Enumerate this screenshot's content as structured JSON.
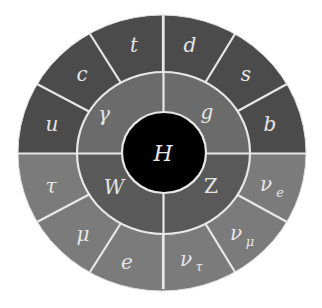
{
  "diagram": {
    "center": {
      "label": "H",
      "name": "higgs-boson"
    },
    "middle_ring": [
      {
        "label": "γ",
        "name": "photon",
        "group": "gauge-boson"
      },
      {
        "label": "g",
        "name": "gluon",
        "group": "gauge-boson"
      },
      {
        "label": "Z",
        "name": "z-boson",
        "group": "gauge-boson"
      },
      {
        "label": "W",
        "name": "w-boson",
        "group": "gauge-boson"
      }
    ],
    "outer_ring_top": [
      {
        "label": "u",
        "name": "up-quark"
      },
      {
        "label": "c",
        "name": "charm-quark"
      },
      {
        "label": "t",
        "name": "top-quark"
      },
      {
        "label": "d",
        "name": "down-quark"
      },
      {
        "label": "s",
        "name": "strange-quark"
      },
      {
        "label": "b",
        "name": "bottom-quark"
      }
    ],
    "outer_ring_bottom": [
      {
        "label": "τ",
        "name": "tau"
      },
      {
        "label": "μ",
        "name": "muon"
      },
      {
        "label": "e",
        "name": "electron"
      },
      {
        "label": "ν",
        "sub": "τ",
        "name": "tau-neutrino"
      },
      {
        "label": "ν",
        "sub": "μ",
        "name": "muon-neutrino"
      },
      {
        "label": "ν",
        "sub": "e",
        "name": "electron-neutrino"
      }
    ],
    "colors": {
      "outer_top": "#4b4b4b",
      "outer_bottom": "#7b7b7b",
      "middle_top": "#6b6b6b",
      "middle_bottom": "#595959",
      "center": "#000000",
      "divider": "#e8e8e8",
      "label": "#e6e6e6"
    }
  }
}
